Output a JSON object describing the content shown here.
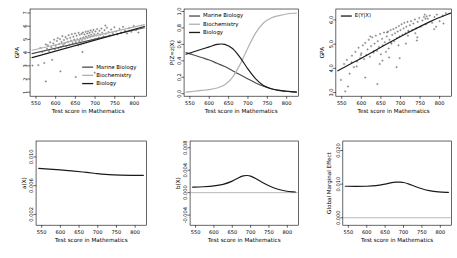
{
  "figure": {
    "layout": "2 rows x 3 columns",
    "background": "#ffffff",
    "shared_xlabel": "Test score in Mathematics",
    "colors": {
      "marine_biology": "#4d4d4d",
      "biochemistry": "#b0b0b0",
      "biology": "#1a1a1a",
      "point": "#555555",
      "axis": "#000000",
      "refline": "#999999"
    }
  },
  "chart_data": [
    {
      "id": "panel-component-regressions",
      "type": "scatter",
      "title": "",
      "xlabel": "Test score in Mathematics",
      "ylabel": "GPA",
      "xlim": [
        535,
        830
      ],
      "ylim": [
        0.7,
        7.3
      ],
      "xticks": [
        550,
        600,
        650,
        700,
        750,
        800
      ],
      "yticks": [
        1,
        2,
        3,
        4,
        5,
        6,
        7
      ],
      "grid": false,
      "legend_position": "bottom-right",
      "legend": [
        "Marine Biology",
        "Biochemistry",
        "Biology"
      ],
      "series": [
        {
          "name": "Marine Biology",
          "type": "line",
          "color": "#4d4d4d",
          "x": [
            540,
            825
          ],
          "y": [
            3.92,
            5.88
          ]
        },
        {
          "name": "Biochemistry",
          "type": "line",
          "color": "#b0b0b0",
          "x": [
            540,
            825
          ],
          "y": [
            4.18,
            6.12
          ]
        },
        {
          "name": "Biology",
          "type": "line",
          "color": "#1a1a1a",
          "x": [
            540,
            825
          ],
          "y": [
            3.62,
            5.98
          ]
        }
      ],
      "points": {
        "name": "observations",
        "n": 110,
        "x": [
          541,
          556,
          561,
          566,
          571,
          575,
          578,
          580,
          583,
          586,
          589,
          591,
          594,
          596,
          598,
          600,
          603,
          605,
          607,
          609,
          611,
          613,
          615,
          617,
          619,
          621,
          623,
          625,
          627,
          629,
          631,
          633,
          635,
          637,
          639,
          641,
          643,
          645,
          647,
          649,
          651,
          653,
          655,
          657,
          658,
          660,
          661,
          663,
          664,
          666,
          667,
          669,
          670,
          671,
          673,
          674,
          676,
          677,
          678,
          680,
          681,
          682,
          684,
          685,
          686,
          688,
          689,
          690,
          692,
          693,
          695,
          696,
          698,
          700,
          701,
          703,
          705,
          707,
          709,
          711,
          713,
          716,
          718,
          721,
          724,
          727,
          730,
          734,
          737,
          741,
          745,
          749,
          753,
          757,
          762,
          766,
          771,
          776,
          781,
          786,
          792,
          798,
          804,
          810,
          575,
          612,
          651,
          668,
          699,
          726
        ],
        "y": [
          3.02,
          3.05,
          4.35,
          4.05,
          3.21,
          4.62,
          4.3,
          4.55,
          4.12,
          4.78,
          4.4,
          3.45,
          4.7,
          4.98,
          4.25,
          4.52,
          4.88,
          5.1,
          4.35,
          4.65,
          5.02,
          4.42,
          4.8,
          5.25,
          4.58,
          4.95,
          4.7,
          5.18,
          4.48,
          5.05,
          4.82,
          5.32,
          4.6,
          5.12,
          4.9,
          5.4,
          4.72,
          5.2,
          4.98,
          5.45,
          4.8,
          5.28,
          5.02,
          4.55,
          5.5,
          4.88,
          5.35,
          5.08,
          4.62,
          5.42,
          4.95,
          5.52,
          5.15,
          4.7,
          5.38,
          5.05,
          5.58,
          5.22,
          4.78,
          5.45,
          5.12,
          5.62,
          5.28,
          4.85,
          5.5,
          5.18,
          5.68,
          5.35,
          4.92,
          5.55,
          5.25,
          5.72,
          5.4,
          5.02,
          5.6,
          5.3,
          5.78,
          5.45,
          5.12,
          5.65,
          5.35,
          5.82,
          5.5,
          5.22,
          5.7,
          5.42,
          5.88,
          5.55,
          5.3,
          5.75,
          5.48,
          5.92,
          5.6,
          5.38,
          5.8,
          5.52,
          5.95,
          5.65,
          5.45,
          5.85,
          5.58,
          6.02,
          5.7,
          5.52,
          1.82,
          2.58,
          2.15,
          4.05,
          2.48,
          6.05
        ]
      }
    },
    {
      "id": "panel-posterior-probabilities",
      "type": "line",
      "title": "",
      "xlabel": "Test score in Mathematics",
      "ylabel": "P(Z=z|X)",
      "xlim": [
        535,
        830
      ],
      "ylim": [
        -0.03,
        1.03
      ],
      "xticks": [
        550,
        600,
        650,
        700,
        750,
        800
      ],
      "yticks": [
        0.0,
        0.2,
        0.4,
        0.6,
        0.8,
        1.0
      ],
      "ytick_labels": [
        "0.0",
        "0.2",
        "0.4",
        "0.6",
        "0.8",
        "1.0"
      ],
      "grid": false,
      "legend_position": "top-left",
      "legend": [
        "Marine Biology",
        "Biochemistry",
        "Biology"
      ],
      "x": [
        540,
        560,
        580,
        600,
        620,
        640,
        660,
        680,
        700,
        720,
        740,
        760,
        780,
        800,
        825
      ],
      "series": [
        {
          "name": "Marine Biology",
          "color": "#4d4d4d",
          "values": [
            0.5,
            0.47,
            0.44,
            0.41,
            0.37,
            0.33,
            0.28,
            0.23,
            0.18,
            0.13,
            0.09,
            0.06,
            0.04,
            0.03,
            0.02
          ]
        },
        {
          "name": "Biochemistry",
          "color": "#b0b0b0",
          "values": [
            0.02,
            0.03,
            0.04,
            0.05,
            0.07,
            0.11,
            0.2,
            0.36,
            0.56,
            0.74,
            0.86,
            0.92,
            0.95,
            0.97,
            0.98
          ]
        },
        {
          "name": "Biology",
          "color": "#1a1a1a",
          "values": [
            0.48,
            0.51,
            0.54,
            0.57,
            0.6,
            0.6,
            0.55,
            0.44,
            0.3,
            0.18,
            0.1,
            0.06,
            0.04,
            0.03,
            0.02
          ]
        }
      ]
    },
    {
      "id": "panel-conditional-mean",
      "type": "scatter",
      "title": "",
      "xlabel": "Test score in Mathematics",
      "ylabel": "GPA",
      "xlim": [
        535,
        830
      ],
      "ylim": [
        2.85,
        6.45
      ],
      "xticks": [
        550,
        600,
        650,
        700,
        750,
        800
      ],
      "yticks": [
        3.0,
        4.0,
        5.0,
        6.0
      ],
      "ytick_labels": [
        "3.0",
        "4.0",
        "5.0",
        "6.0"
      ],
      "grid": false,
      "legend_position": "top-left",
      "legend": [
        "E(Y|X)"
      ],
      "series": [
        {
          "name": "E(Y|X)",
          "type": "line",
          "color": "#1a1a1a",
          "x": [
            540,
            600,
            660,
            720,
            780,
            828
          ],
          "y": [
            3.9,
            4.42,
            4.96,
            5.48,
            5.96,
            6.28
          ]
        }
      ],
      "points": {
        "name": "observations",
        "n": 108,
        "x": [
          548,
          556,
          563,
          570,
          576,
          581,
          585,
          589,
          593,
          597,
          600,
          604,
          607,
          610,
          613,
          616,
          619,
          622,
          625,
          628,
          631,
          634,
          637,
          640,
          642,
          645,
          648,
          650,
          653,
          655,
          658,
          660,
          663,
          665,
          668,
          670,
          672,
          675,
          677,
          679,
          682,
          684,
          686,
          689,
          691,
          693,
          696,
          698,
          700,
          703,
          705,
          708,
          710,
          713,
          715,
          718,
          721,
          724,
          727,
          730,
          733,
          737,
          740,
          744,
          748,
          752,
          756,
          760,
          765,
          770,
          775,
          781,
          787,
          793,
          800,
          808,
          816,
          566,
          588,
          610,
          632,
          654,
          676,
          698,
          720,
          742,
          764,
          786,
          575,
          599,
          623,
          647,
          671,
          695,
          719,
          743,
          767,
          791,
          559,
          641,
          666,
          690,
          714,
          738,
          762,
          810
        ],
        "y": [
          3.52,
          4.18,
          4.35,
          3.78,
          4.52,
          4.05,
          4.68,
          4.28,
          4.85,
          4.42,
          4.62,
          4.95,
          4.38,
          5.05,
          4.55,
          4.78,
          5.18,
          4.48,
          4.92,
          5.28,
          4.65,
          5.02,
          5.35,
          4.72,
          5.12,
          4.88,
          5.42,
          4.58,
          5.22,
          4.95,
          5.48,
          5.08,
          4.68,
          5.32,
          5.52,
          4.82,
          5.18,
          5.58,
          5.02,
          5.38,
          5.62,
          5.12,
          5.45,
          5.68,
          5.25,
          5.52,
          5.75,
          5.32,
          5.58,
          5.82,
          5.38,
          5.65,
          5.88,
          5.45,
          5.72,
          5.92,
          5.52,
          5.78,
          5.95,
          5.58,
          5.85,
          6.02,
          5.65,
          5.92,
          6.08,
          5.72,
          5.98,
          6.12,
          5.82,
          6.05,
          6.18,
          5.88,
          6.12,
          6.22,
          5.95,
          6.18,
          6.28,
          3.25,
          4.08,
          3.62,
          4.72,
          4.32,
          5.08,
          4.42,
          5.55,
          5.15,
          6.05,
          5.62,
          4.25,
          4.55,
          5.32,
          4.18,
          4.45,
          4.95,
          5.35,
          5.28,
          6.15,
          5.72,
          3.05,
          3.35,
          5.48,
          4.05,
          5.02,
          5.45,
          6.22,
          5.85
        ]
      }
    },
    {
      "id": "panel-a-of-x",
      "type": "line",
      "title": "",
      "xlabel": "Test score in Mathematics",
      "ylabel": "a(X)",
      "xlim": [
        535,
        830
      ],
      "ylim": [
        0.0005,
        0.0122
      ],
      "xticks": [
        550,
        600,
        650,
        700,
        750,
        800
      ],
      "yticks": [
        0.002,
        0.006,
        0.01
      ],
      "ytick_labels": [
        "0.002",
        "0.006",
        "0.010"
      ],
      "grid": false,
      "legend_position": "none",
      "x": [
        542,
        570,
        600,
        630,
        660,
        690,
        710,
        730,
        760,
        790,
        822
      ],
      "series": [
        {
          "name": "a(X)",
          "color": "#1a1a1a",
          "values": [
            0.0084,
            0.0083,
            0.00818,
            0.00805,
            0.0079,
            0.00772,
            0.0076,
            0.00752,
            0.00746,
            0.00743,
            0.00742
          ]
        }
      ]
    },
    {
      "id": "panel-b-of-x",
      "type": "line",
      "title": "",
      "xlabel": "Test score in Mathematics",
      "ylabel": "b(X)",
      "xlim": [
        535,
        830
      ],
      "ylim": [
        -0.0058,
        0.0092
      ],
      "xticks": [
        550,
        600,
        650,
        700,
        750,
        800
      ],
      "yticks": [
        -0.004,
        0.0,
        0.004,
        0.008
      ],
      "ytick_labels": [
        "-0.004",
        "0.000",
        "0.004",
        "0.008"
      ],
      "grid": false,
      "reference_line": {
        "y": 0.0,
        "color": "#999999"
      },
      "legend_position": "none",
      "x": [
        542,
        570,
        600,
        625,
        650,
        665,
        680,
        690,
        700,
        715,
        730,
        750,
        770,
        795,
        822
      ],
      "series": [
        {
          "name": "b(X)",
          "color": "#1a1a1a",
          "values": [
            0.00098,
            0.00105,
            0.0012,
            0.00148,
            0.00205,
            0.00258,
            0.00298,
            0.00305,
            0.00295,
            0.00248,
            0.0019,
            0.00122,
            0.0007,
            0.0003,
            0.00012
          ]
        }
      ]
    },
    {
      "id": "panel-global-marginal-effect",
      "type": "line",
      "title": "",
      "xlabel": "Test score in Mathematics",
      "ylabel": "Global Marginal Effect",
      "xlim": [
        535,
        830
      ],
      "ylim": [
        -0.0022,
        0.0228
      ],
      "xticks": [
        550,
        600,
        650,
        700,
        750,
        800
      ],
      "yticks": [
        0.0,
        0.01,
        0.02
      ],
      "ytick_labels": [
        "0.000",
        "0.010",
        "0.020"
      ],
      "grid": false,
      "reference_line": {
        "y": 0.0,
        "color": "#999999"
      },
      "legend_position": "none",
      "x": [
        542,
        570,
        600,
        625,
        650,
        665,
        680,
        690,
        700,
        715,
        730,
        750,
        770,
        795,
        822
      ],
      "series": [
        {
          "name": "Global Marginal Effect",
          "color": "#1a1a1a",
          "values": [
            0.00938,
            0.00935,
            0.00938,
            0.00955,
            0.01,
            0.01038,
            0.01058,
            0.0106,
            0.01048,
            0.01,
            0.00938,
            0.00862,
            0.00805,
            0.00768,
            0.00755
          ]
        }
      ]
    }
  ]
}
